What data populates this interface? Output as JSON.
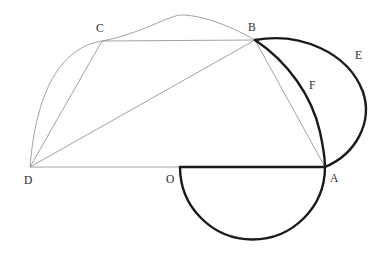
{
  "figure": {
    "background_color": "#ffffff",
    "thin_line_color": "#8a8a8a",
    "bold_line_color": "#1a1a1a",
    "label_color": "#2b2b2b"
  },
  "points": {
    "A": {
      "label": "A",
      "x": 325,
      "y": 167,
      "label_x": 330,
      "label_y": 182
    },
    "B": {
      "label": "B",
      "x": 255,
      "y": 40,
      "label_x": 248,
      "label_y": 31
    },
    "C": {
      "label": "C",
      "x": 102,
      "y": 41,
      "label_x": 96,
      "label_y": 32
    },
    "D": {
      "label": "D",
      "x": 30,
      "y": 167,
      "label_x": 24,
      "label_y": 184
    },
    "O": {
      "label": "O",
      "x": 180,
      "y": 167,
      "label_x": 166,
      "label_y": 183
    },
    "E": {
      "label": "E",
      "x": 365,
      "y": 103,
      "label_x": 355,
      "label_y": 59
    },
    "F": {
      "label": "F",
      "x": 322,
      "y": 130,
      "label_x": 309,
      "label_y": 89
    }
  },
  "segments": [
    {
      "name": "segment-DA-baseline-thin",
      "from": "D",
      "to": "O",
      "weight": "thin"
    },
    {
      "name": "segment-OA-baseline-bold",
      "from": "O",
      "to": "A",
      "weight": "bold"
    },
    {
      "name": "segment-CB-top",
      "from": "C",
      "to": "B",
      "weight": "thin"
    },
    {
      "name": "segment-DC-left-side",
      "from": "D",
      "to": "C",
      "weight": "thin"
    },
    {
      "name": "segment-DB-diagonal",
      "from": "D",
      "to": "B",
      "weight": "thin"
    },
    {
      "name": "segment-BA-right-side",
      "from": "B",
      "to": "A",
      "weight": "thin"
    }
  ],
  "arcs": [
    {
      "name": "arc-large-circumcircle-DCB",
      "weight": "thin",
      "through": [
        "D",
        "C",
        "B"
      ],
      "apex_x": 180,
      "apex_y": 15,
      "description": "Light circular arc passing through D, C and B"
    },
    {
      "name": "arc-BEA-outer",
      "weight": "bold",
      "from": "B",
      "to": "A",
      "via": "E",
      "bulge_max_x": 365,
      "description": "Bold arc from B to A bulging right through E"
    },
    {
      "name": "arc-BFA-inner",
      "weight": "bold",
      "from": "B",
      "to": "A",
      "via": "F",
      "bulge_max_x": 322,
      "description": "Bold arc from B to A bulging right through F"
    },
    {
      "name": "arc-semicircle-OA-lower",
      "weight": "bold",
      "from": "O",
      "to": "A",
      "center_x": 252,
      "center_y": 167,
      "radius": 73,
      "lowest_y": 240,
      "description": "Bold lower semicircle on diameter OA"
    }
  ],
  "labels": [
    "A",
    "B",
    "C",
    "D",
    "E",
    "F",
    "O"
  ]
}
